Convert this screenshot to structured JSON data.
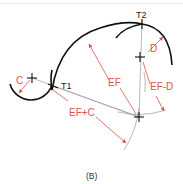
{
  "figure": {
    "caption": "(B)",
    "labels": {
      "c": "C",
      "t1": "T1",
      "t2": "T2",
      "d": "D",
      "ef": "EF",
      "ef_d": "EF-D",
      "ef_c": "EF+C"
    },
    "colors": {
      "curve": "#111111",
      "construction": "#9a9a9a",
      "dimension": "#d9534f",
      "text_black": "#222222"
    }
  }
}
